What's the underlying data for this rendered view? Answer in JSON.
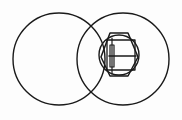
{
  "figure": {
    "title": "Overlapping circles with hexagonal slotted nut",
    "background_color": "#fdfdfd",
    "stroke_color": "#1a1a1a",
    "width": 182,
    "height": 120,
    "style": "technical line drawing, black outline on white"
  },
  "chart_data": {
    "type": "diagram",
    "shapes": [
      {
        "name": "left-circle",
        "kind": "circle",
        "cx": 59,
        "cy": 59,
        "r": 46,
        "stroke": "#1a1a1a",
        "stroke_width": 1.4,
        "fill": "none"
      },
      {
        "name": "right-circle",
        "kind": "circle",
        "cx": 123,
        "cy": 59,
        "r": 46,
        "stroke": "#1a1a1a",
        "stroke_width": 1.4,
        "fill": "none"
      },
      {
        "name": "hexagon-nut",
        "kind": "polygon",
        "points": "110,33 128,33 138,57 128,76 110,76 101,57",
        "stroke": "#1a1a1a",
        "stroke_width": 1.5,
        "fill": "none"
      },
      {
        "name": "inner-circle",
        "kind": "circle",
        "cx": 119,
        "cy": 55,
        "r": 20,
        "stroke": "#1a1a1a",
        "stroke_width": 1.4,
        "fill": "none"
      },
      {
        "name": "inner-square",
        "kind": "rect",
        "x": 107,
        "y": 40,
        "width": 28,
        "height": 30,
        "stroke": "#1a1a1a",
        "stroke_width": 1.3,
        "fill": "none"
      },
      {
        "name": "slot-horizontal-line",
        "kind": "line",
        "x1": 109,
        "y1": 56,
        "x2": 136,
        "y2": 56,
        "stroke": "#1a1a1a",
        "stroke_width": 1.5
      },
      {
        "name": "slot-vertical-bar",
        "kind": "rect",
        "x": 110,
        "y": 45,
        "width": 4,
        "height": 22,
        "stroke": "#1a1a1a",
        "stroke_width": 1.2,
        "fill": "none"
      },
      {
        "name": "slot-vertical-stem",
        "kind": "line",
        "x1": 112,
        "y1": 38,
        "x2": 112,
        "y2": 74,
        "stroke": "#1a1a1a",
        "stroke_width": 1.2
      }
    ],
    "intersections": [
      {
        "name": "upper-crossing",
        "x": 91,
        "y": 13
      },
      {
        "name": "lower-crossing",
        "x": 91,
        "y": 106
      }
    ],
    "legend": [],
    "annotations": [],
    "grid": false,
    "axes": false
  }
}
